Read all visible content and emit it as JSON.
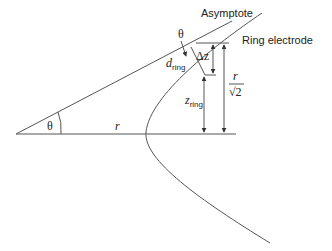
{
  "diagram": {
    "labels": {
      "asymptote": "Asymptote",
      "ring_electrode": "Ring electrode",
      "theta_top": "θ",
      "theta_apex": "θ",
      "delta_z": "Δz",
      "d_ring_main": "d",
      "d_ring_sub": "ring",
      "z_ring_main": "z",
      "z_ring_sub": "ring",
      "r_base": "r",
      "r_frac_num": "r",
      "r_frac_den": "√2"
    },
    "colors": {
      "line": "#555555",
      "text": "#222222",
      "background": "#ffffff"
    }
  }
}
